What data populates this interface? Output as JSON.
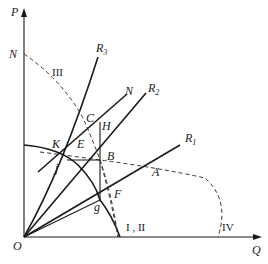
{
  "axes": {
    "y_label": "P",
    "x_label": "Q",
    "origin_label": "O"
  },
  "curves": {
    "N_intercept_label": "N",
    "III_label": "III",
    "I_II_label": "I , II",
    "IV_label": "IV"
  },
  "rays": {
    "R3": {
      "main": "R",
      "sub": "3"
    },
    "R2": {
      "main": "R",
      "sub": "2"
    },
    "R1": {
      "main": "R",
      "sub": "1"
    },
    "N_line_label": "N"
  },
  "points": {
    "C": "C",
    "H": "H",
    "E": "E",
    "K": "K",
    "B": "B",
    "j": "j",
    "A": "A",
    "F": "F",
    "g": "g"
  },
  "colors": {
    "line": "#1a1a1a",
    "background": "#ffffff"
  }
}
